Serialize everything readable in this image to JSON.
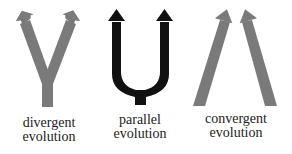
{
  "colors": {
    "gray_arrow": "#7a7a7a",
    "black_arrow": "#111111",
    "label_text": "#222222",
    "background": "#ffffff"
  },
  "panels": [
    {
      "id": "divergent",
      "shape": "Y-shaped arrows branching upward from a single stem",
      "arrow_color": "gray",
      "label_line1": "divergent",
      "label_line2": "evolution"
    },
    {
      "id": "parallel",
      "shape": "U-shaped arrows rising in parallel from a single stem",
      "arrow_color": "black",
      "label_line1": "parallel",
      "label_line2": "evolution"
    },
    {
      "id": "convergent",
      "shape": "two separate arrows converging toward each other at top",
      "arrow_color": "gray",
      "label_line1": "convergent",
      "label_line2": "evolution"
    }
  ]
}
